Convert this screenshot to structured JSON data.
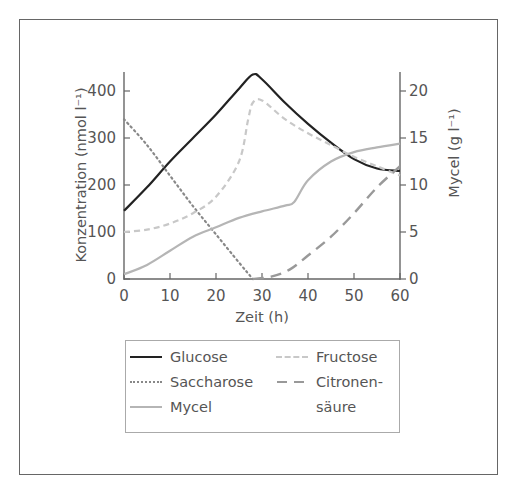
{
  "chart_data": {
    "type": "line",
    "title": "",
    "xlabel": "Zeit (h)",
    "ylabel": "Konzentration (nmol l⁻¹)",
    "ylabel_right": "Mycel (g l⁻¹)",
    "xlim": [
      0,
      60
    ],
    "ylim": [
      0,
      400
    ],
    "ylim_right": [
      0,
      20
    ],
    "x_ticks": [
      0,
      10,
      20,
      30,
      40,
      50,
      60
    ],
    "y_ticks": [
      0,
      100,
      200,
      300,
      400
    ],
    "y_ticks_right": [
      0,
      5,
      10,
      15,
      20
    ],
    "grid": false,
    "legend_position": "below",
    "series": [
      {
        "name": "Glucose",
        "axis": "left",
        "style": "solid-dark",
        "x": [
          0,
          5,
          10,
          15,
          20,
          25,
          28,
          30,
          35,
          40,
          45,
          50,
          55,
          60
        ],
        "values": [
          145,
          195,
          250,
          300,
          350,
          405,
          435,
          425,
          375,
          330,
          290,
          255,
          235,
          230
        ]
      },
      {
        "name": "Saccharose",
        "axis": "left",
        "style": "dotted",
        "x": [
          0,
          5,
          10,
          15,
          20,
          25,
          28
        ],
        "values": [
          340,
          285,
          220,
          155,
          95,
          35,
          0
        ]
      },
      {
        "name": "Mycel",
        "axis": "right",
        "style": "solid-light",
        "x": [
          0,
          5,
          10,
          15,
          20,
          25,
          30,
          35,
          37,
          40,
          45,
          50,
          55,
          60
        ],
        "values": [
          0.5,
          1.5,
          3.0,
          4.5,
          5.5,
          6.5,
          7.2,
          7.8,
          8.2,
          10.5,
          12.5,
          13.5,
          14.0,
          14.4
        ]
      },
      {
        "name": "Fructose",
        "axis": "left",
        "style": "dashed-light",
        "x": [
          0,
          5,
          10,
          15,
          20,
          25,
          27,
          28,
          30,
          35,
          40,
          45,
          50,
          55,
          60
        ],
        "values": [
          100,
          105,
          118,
          140,
          175,
          250,
          340,
          375,
          380,
          340,
          310,
          285,
          260,
          240,
          220
        ]
      },
      {
        "name": "Citronensäure",
        "axis": "left",
        "style": "dashed-dark",
        "x": [
          28,
          32,
          36,
          40,
          45,
          50,
          55,
          60
        ],
        "values": [
          0,
          5,
          20,
          50,
          90,
          140,
          195,
          240
        ]
      }
    ]
  },
  "axes": {
    "x_title": "Zeit (h)",
    "y_left_title": "Konzentration (nmol l⁻¹)",
    "y_right_title": "Mycel (g l⁻¹)",
    "x_ticks": [
      "0",
      "10",
      "20",
      "30",
      "40",
      "50",
      "60"
    ],
    "y_left_ticks": [
      "0",
      "100",
      "200",
      "300",
      "400"
    ],
    "y_right_ticks": [
      "0",
      "5",
      "10",
      "15",
      "20"
    ]
  },
  "legend": {
    "glucose": "Glucose",
    "saccharose": "Saccharose",
    "mycel": "Mycel",
    "fructose": "Fructose",
    "citronensaeure_line1": "Citronen-",
    "citronensaeure_line2": "säure"
  }
}
